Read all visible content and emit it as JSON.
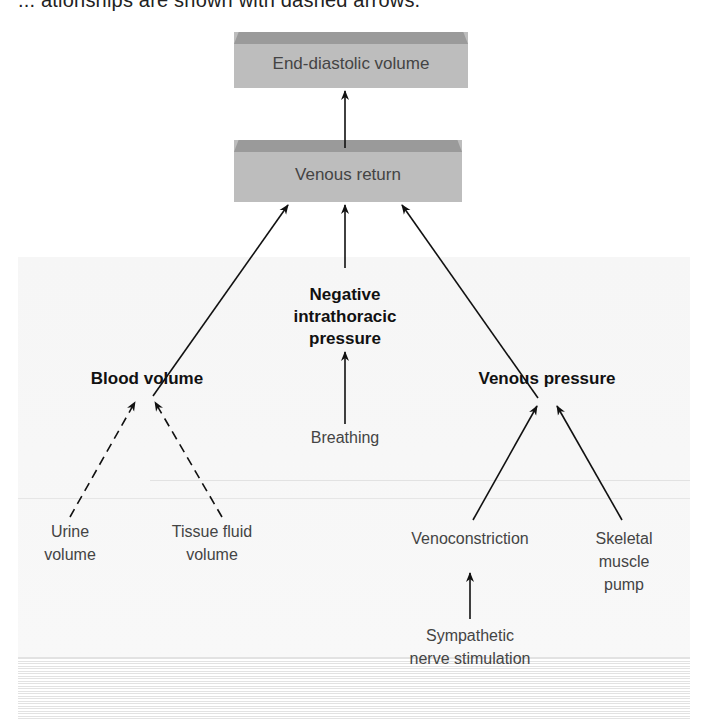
{
  "caption_fragment": "... ationships are shown with dashed arrows.",
  "colors": {
    "box_fill": "#bdbdbd",
    "box_bevel": "#9a9a9a",
    "arrow": "#111111",
    "text_regular": "#444444",
    "text_bold": "#111111"
  },
  "nodes": {
    "end_diastolic_volume": "End-diastolic volume",
    "venous_return": "Venous return",
    "negative_intrathoracic_pressure": [
      "Negative",
      "intrathoracic",
      "pressure"
    ],
    "blood_volume": "Blood volume",
    "venous_pressure": "Venous pressure",
    "breathing": "Breathing",
    "urine_volume": [
      "Urine",
      "volume"
    ],
    "tissue_fluid_volume": [
      "Tissue fluid",
      "volume"
    ],
    "venoconstriction": "Venoconstriction",
    "skeletal_muscle_pump": [
      "Skeletal",
      "muscle",
      "pump"
    ],
    "sympathetic_nerve_stimulation": [
      "Sympathetic",
      "nerve stimulation"
    ]
  },
  "edges": [
    {
      "from": "Venous return",
      "to": "End-diastolic volume",
      "style": "solid"
    },
    {
      "from": "Blood volume",
      "to": "Venous return",
      "style": "solid"
    },
    {
      "from": "Negative intrathoracic pressure",
      "to": "Venous return",
      "style": "solid"
    },
    {
      "from": "Venous pressure",
      "to": "Venous return",
      "style": "solid"
    },
    {
      "from": "Breathing",
      "to": "Negative intrathoracic pressure",
      "style": "solid"
    },
    {
      "from": "Urine volume",
      "to": "Blood volume",
      "style": "dashed"
    },
    {
      "from": "Tissue fluid volume",
      "to": "Blood volume",
      "style": "dashed"
    },
    {
      "from": "Venoconstriction",
      "to": "Venous pressure",
      "style": "solid"
    },
    {
      "from": "Skeletal muscle pump",
      "to": "Venous pressure",
      "style": "solid"
    },
    {
      "from": "Sympathetic nerve stimulation",
      "to": "Venoconstriction",
      "style": "solid"
    }
  ]
}
